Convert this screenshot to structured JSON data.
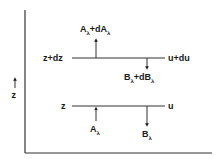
{
  "diagram": {
    "axis_label": "z",
    "upper_level": {
      "left_label": "z+dz",
      "right_label": "u+du",
      "upward_flux": {
        "base": "A",
        "sub": "λ",
        "mid": "+dA",
        "sub2": "λ"
      },
      "downward_flux": {
        "base": "B",
        "sub": "λ",
        "mid": "+dB",
        "sub2": "λ"
      }
    },
    "lower_level": {
      "left_label": "z",
      "right_label": "u",
      "upward_flux": {
        "base": "A",
        "sub": "λ"
      },
      "downward_flux": {
        "base": "B",
        "sub": "λ"
      }
    },
    "colors": {
      "ink": "#1a1a1a",
      "background": "#ffffff"
    }
  }
}
